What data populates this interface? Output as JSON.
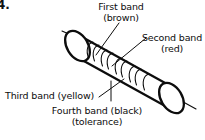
{
  "figure": {
    "number": "4.",
    "object_label": "resistor-body"
  },
  "callouts": [
    {
      "id": "first-band",
      "line1": "First band",
      "line2": "(brown)",
      "color_name": "brown",
      "color_hex": "#7b4a12"
    },
    {
      "id": "second-band",
      "line1": "Second band",
      "line2": "(red)",
      "color_name": "red",
      "color_hex": "#c32a20"
    },
    {
      "id": "third-band",
      "line1": "Third band (yellow)",
      "line2": "",
      "color_name": "yellow",
      "color_hex": "#e8c024"
    },
    {
      "id": "fourth-band",
      "line1": "Fourth band (black)",
      "line2": "(tolerance)",
      "color_name": "black",
      "color_hex": "#111111"
    }
  ],
  "style": {
    "ink": "#0d0d0d",
    "paper": "#ffffff",
    "stroke_heavy": "2.2",
    "stroke_light": "1.0"
  }
}
